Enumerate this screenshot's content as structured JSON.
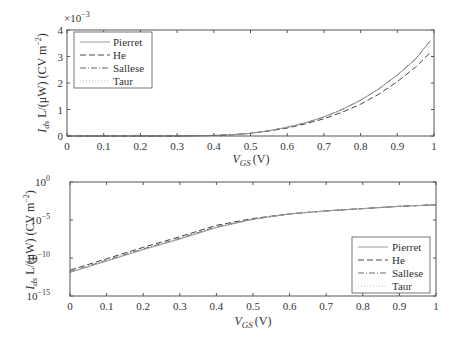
{
  "chart_data": [
    {
      "type": "line",
      "title": "",
      "xlabel": "V_GS (V)",
      "ylabel": "I_ds L/(μW) (CV m^-2)",
      "y_multiplier": "×10^-3",
      "xlim": [
        0,
        1
      ],
      "ylim": [
        0,
        4
      ],
      "yscale": "linear",
      "x_ticks": [
        "0",
        "0.1",
        "0.2",
        "0.3",
        "0.4",
        "0.5",
        "0.6",
        "0.7",
        "0.8",
        "0.9",
        "1"
      ],
      "y_ticks": [
        "0",
        "1",
        "2",
        "3",
        "4"
      ],
      "legend_position": "upper left",
      "grid": false,
      "x": [
        0,
        0.1,
        0.2,
        0.3,
        0.4,
        0.45,
        0.5,
        0.55,
        0.6,
        0.65,
        0.7,
        0.75,
        0.8,
        0.85,
        0.9,
        0.95,
        0.99
      ],
      "series": [
        {
          "name": "Pierret",
          "style": "solid",
          "values": [
            0,
            0,
            0,
            0,
            0.02,
            0.05,
            0.1,
            0.2,
            0.33,
            0.5,
            0.72,
            1.0,
            1.35,
            1.78,
            2.3,
            2.9,
            3.6
          ]
        },
        {
          "name": "He",
          "style": "dashed",
          "values": [
            0,
            0,
            0,
            0,
            0.02,
            0.05,
            0.1,
            0.19,
            0.3,
            0.46,
            0.65,
            0.9,
            1.2,
            1.58,
            2.05,
            2.6,
            3.15
          ]
        },
        {
          "name": "Sallese",
          "style": "dashdot",
          "values": [
            0,
            0,
            0,
            0,
            0.02,
            0.05,
            0.1,
            0.2,
            0.33,
            0.5,
            0.72,
            1.0,
            1.35,
            1.78,
            2.3,
            2.9,
            3.6
          ]
        },
        {
          "name": "Taur",
          "style": "dotted",
          "values": [
            0,
            0,
            0,
            0,
            0.02,
            0.05,
            0.1,
            0.2,
            0.33,
            0.5,
            0.72,
            1.0,
            1.35,
            1.78,
            2.3,
            2.9,
            3.6
          ]
        }
      ]
    },
    {
      "type": "line",
      "title": "",
      "xlabel": "V_GS (V)",
      "ylabel": "I_ds L/(μW) (CV m^-2)",
      "xlim": [
        0,
        1
      ],
      "ylim_exponent": [
        -15,
        0
      ],
      "yscale": "log",
      "x_ticks": [
        "0",
        "0.1",
        "0.2",
        "0.3",
        "0.4",
        "0.5",
        "0.6",
        "0.7",
        "0.8",
        "0.9",
        "1"
      ],
      "y_ticks": [
        "10^-15",
        "10^-10",
        "10^-5",
        "10^0"
      ],
      "legend_position": "lower right",
      "grid": false,
      "x": [
        0,
        0.1,
        0.2,
        0.3,
        0.4,
        0.5,
        0.6,
        0.7,
        0.8,
        0.9,
        1.0
      ],
      "series_log10": [
        {
          "name": "Pierret",
          "style": "solid",
          "values": [
            -11.9,
            -10.4,
            -8.9,
            -7.5,
            -6.0,
            -4.9,
            -4.2,
            -3.8,
            -3.5,
            -3.2,
            -3.0
          ]
        },
        {
          "name": "He",
          "style": "dashed",
          "values": [
            -11.6,
            -10.1,
            -8.6,
            -7.2,
            -5.7,
            -4.8,
            -4.2,
            -3.8,
            -3.5,
            -3.2,
            -3.0
          ]
        },
        {
          "name": "Sallese",
          "style": "dashdot",
          "values": [
            -11.8,
            -10.3,
            -8.8,
            -7.4,
            -5.9,
            -4.9,
            -4.2,
            -3.8,
            -3.5,
            -3.2,
            -3.0
          ]
        },
        {
          "name": "Taur",
          "style": "dotted",
          "values": [
            -11.9,
            -10.4,
            -8.9,
            -7.5,
            -6.0,
            -4.9,
            -4.2,
            -3.8,
            -3.5,
            -3.2,
            -3.0
          ]
        }
      ]
    }
  ],
  "labels": {
    "top_multiplier_base": "×10",
    "top_multiplier_exp": "−3",
    "ylabel_I": "I",
    "ylabel_ds": "ds",
    "ylabel_rest": " L/(μW) (CV m",
    "ylabel_exp": "−2",
    "ylabel_close": ")",
    "xlabel_V": "V",
    "xlabel_GS": "GS",
    "xlabel_unit": "(V)",
    "log_base": "10"
  },
  "legend": [
    "Pierret",
    "He",
    "Sallese",
    "Taur"
  ]
}
